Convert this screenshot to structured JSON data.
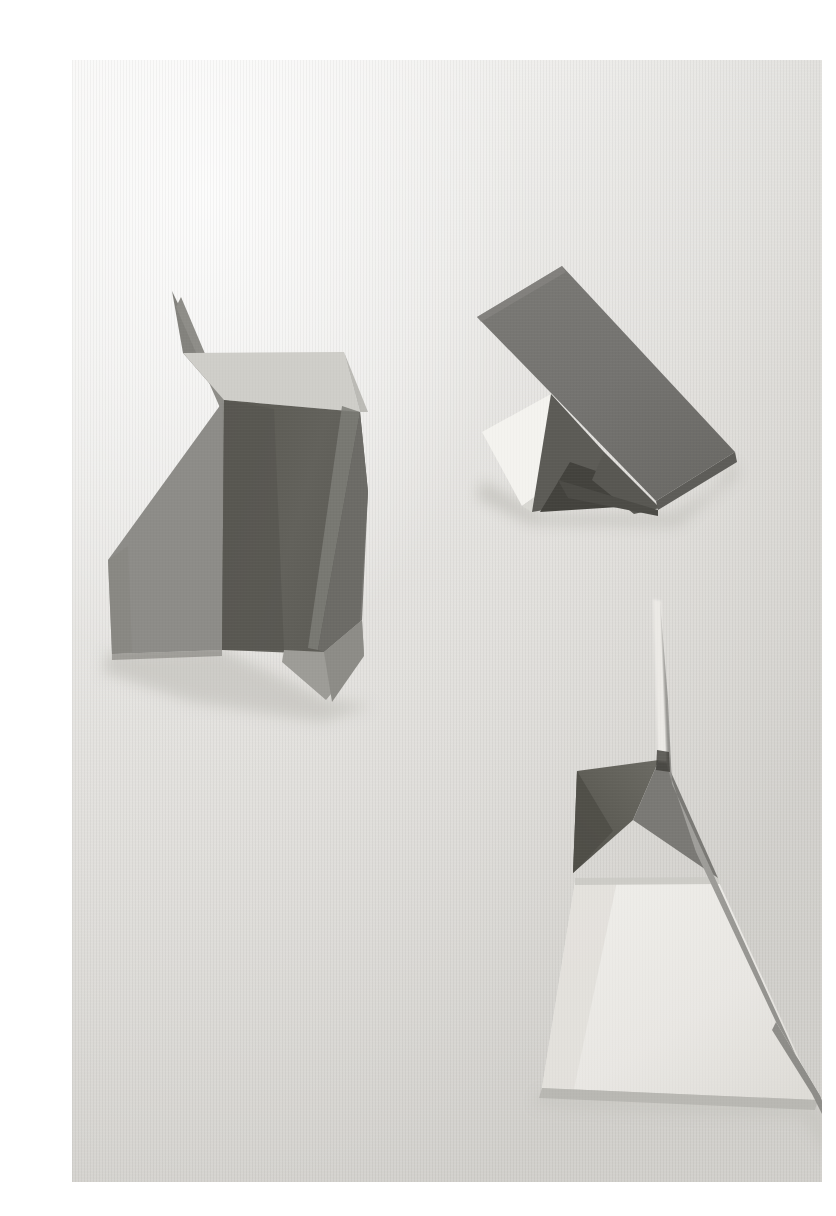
{
  "image": {
    "title": "Three folded paper sculptures on a pale gray surface",
    "medium": "photograph",
    "subject": "paper-sculpture-still-life",
    "canvas": {
      "width": 836,
      "height": 1216
    },
    "page_background": "#ffffff",
    "photo_frame": {
      "x": 72,
      "y": 60,
      "width": 750,
      "height": 1122
    }
  },
  "palette": {
    "page_white": "#ffffff",
    "backdrop_light": "#efeeec",
    "backdrop_mid": "#dddcd8",
    "backdrop_shadow": "#d2d1cd",
    "paper_white": "#f6f5f2",
    "paper_pale": "#e9e8e3",
    "paper_light_gray": "#c9c8c4",
    "paper_mid_gray": "#a9a8a4",
    "paper_gray": "#8f8e8a",
    "paper_dark_gray": "#6d6c69",
    "paper_darkest": "#56554f",
    "cast_shadow": "#c4c3bf",
    "edge_highlight": "#f2f1ee",
    "crease_line": "#7e7d79"
  },
  "backdrop": {
    "gradient_stops": [
      {
        "offset": 0.0,
        "color": "#f4f3f1"
      },
      {
        "offset": 0.28,
        "color": "#e8e7e4"
      },
      {
        "offset": 0.55,
        "color": "#dedcd8"
      },
      {
        "offset": 1.0,
        "color": "#d6d4d0"
      }
    ],
    "horizon_y": 470,
    "vignette_color": "#cfcec9"
  },
  "objects": [
    {
      "id": "sculpture-left",
      "name": "folded-fin-sculpture",
      "description": "Upright folded sheet with a thin spike at the apex, a dark shadowed central face and two lighter gray flaps",
      "bbox": {
        "x": 30,
        "y": 225,
        "width": 300,
        "height": 425
      },
      "faces": [
        {
          "name": "spike-sliver",
          "fill": "#7f7e7a",
          "points": "100,231 110,292 152,338"
        },
        {
          "name": "thin-fold-line",
          "fill": "#8c8b87",
          "points": "108,236 152,340 150,348 104,246"
        },
        {
          "name": "upper-light-flap",
          "fill": "#cfcec9",
          "points": "110,292 272,292 286,352 152,340"
        },
        {
          "name": "upper-right-wing",
          "fill": "#bab9b5",
          "points": "272,292 293,350 286,352"
        },
        {
          "name": "left-gray-flap",
          "fill": "#8d8c88",
          "points": "152,340 36,500 40,592 148,588 152,560"
        },
        {
          "name": "dark-center-face",
          "fill": "#5f5e59",
          "points": "152,340 286,352 296,430 288,560 250,592 148,588"
        },
        {
          "name": "dark-center-face-shadow",
          "fill": "#59584f",
          "points": "152,340 200,348 210,590 148,588"
        },
        {
          "name": "crease-highlight",
          "fill": "#7c7b76",
          "points": "270,345 286,352 244,588 234,586"
        },
        {
          "name": "right-wing",
          "fill": "#8a8985",
          "points": "286,352 296,430 288,560 250,592 244,588"
        },
        {
          "name": "lower-right-wing",
          "fill": "#9a9995",
          "points": "210,590 250,592 288,560 290,590 252,638 208,600"
        },
        {
          "name": "lower-wing-tip",
          "fill": "#8b8a86",
          "points": "250,592 290,560 292,596 260,640"
        }
      ],
      "cast_shadow": {
        "fill": "#cac9c4",
        "points": "36,592 148,588 252,638 300,646 250,660 120,640 34,610"
      }
    },
    {
      "id": "sculpture-top-right",
      "name": "tent-prism-sculpture",
      "description": "Leaning rectangular dark panel resting over a bright white folded wedge",
      "bbox": {
        "x": 395,
        "y": 200,
        "width": 275,
        "height": 250
      },
      "faces": [
        {
          "name": "white-panel",
          "fill": "#f4f3ef",
          "points": "414,372 481,336 522,394 452,444"
        },
        {
          "name": "white-panel-shade",
          "fill": "#dcdbd6",
          "points": "452,444 522,394 528,404 462,450"
        },
        {
          "name": "inner-shadow-wedge",
          "fill": "#5a5954",
          "points": "481,336 530,392 540,436 462,450"
        },
        {
          "name": "inner-dark-slot",
          "fill": "#45443f",
          "points": "500,404 548,420 560,444 470,450"
        },
        {
          "name": "dark-top-panel",
          "fill": "#74736f",
          "points": "405,257 490,207 663,392 584,440"
        },
        {
          "name": "dark-top-panel-edge",
          "fill": "#5f5e5a",
          "points": "584,440 663,392 664,401 586,448"
        },
        {
          "name": "dark-under-fold",
          "fill": "#4e4d48",
          "points": "486,420 584,440 586,448 498,436"
        },
        {
          "name": "right-under-flap",
          "fill": "#5b5a55",
          "points": "530,392 586,448 560,452 520,420"
        }
      ],
      "cast_shadow": {
        "fill": "#c8c7c2",
        "points": "414,420 470,452 600,452 640,430 662,398 664,412 604,462 460,462 408,436"
      }
    },
    {
      "id": "sculpture-bottom-right",
      "name": "sail-pyramid-sculpture",
      "description": "Tall gray sail blade rising from a pale trapezoid base with a dark triangular wedge at the left",
      "bbox": {
        "x": 460,
        "y": 535,
        "width": 315,
        "height": 560
      },
      "faces": [
        {
          "name": "sail-edge-highlight",
          "fill": "#ebe9e5",
          "points": "582,540 588,542 592,700 584,700"
        },
        {
          "name": "sail-blade",
          "fill": "#9a9995",
          "points": "588,542 592,700 700,960 745,1035 765,1085 735,1020 620,790 596,700"
        },
        {
          "name": "sail-blade-wide",
          "fill": "#94938f",
          "points": "588,542 700,960 745,1035 765,1085 708,1000 600,720 592,640"
        },
        {
          "name": "sail-front-face",
          "fill": "#a3a29e",
          "points": "588,542 592,700 596,700 620,790 700,960 745,1035 730,1010 640,822 600,700"
        },
        {
          "name": "dark-wedge",
          "fill": "#5e5d57",
          "points": "587,700 505,712 502,812 560,760"
        },
        {
          "name": "dark-wedge-shadow",
          "fill": "#53524c",
          "points": "505,712 502,812 540,770"
        },
        {
          "name": "wedge-right-face",
          "fill": "#787773",
          "points": "587,700 592,700 640,818 560,760"
        },
        {
          "name": "base-top-strip",
          "fill": "#e3e2dd",
          "points": "503,820 640,818 645,826 503,828"
        },
        {
          "name": "base-trapezoid",
          "fill": "#eceae6",
          "points": "503,828 645,826 745,1038 470,1026"
        },
        {
          "name": "base-trapezoid-shade",
          "fill": "#dfddd8",
          "points": "503,828 540,828 500,1028 470,1026"
        },
        {
          "name": "base-bottom-edge",
          "fill": "#bcbbb6",
          "points": "470,1026 745,1038 742,1046 468,1034"
        }
      ],
      "cast_shadow": {
        "fill": "#c9c8c3",
        "points": "468,1032 745,1042 770,1090 758,1096 730,1056 600,1052 466,1044"
      }
    }
  ],
  "notes": {
    "lighting": "soft diffuse light from the upper left",
    "surface_texture": "fine vertical linen-like weave",
    "orientation": "portrait"
  }
}
